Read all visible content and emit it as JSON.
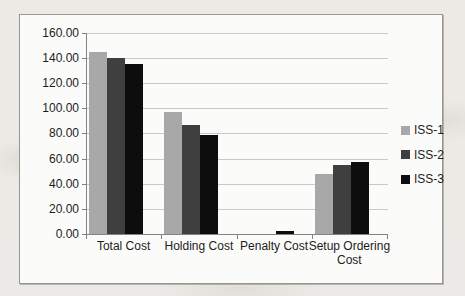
{
  "chart_data": {
    "type": "bar",
    "title": "",
    "xlabel": "",
    "ylabel": "",
    "categories": [
      "Total Cost",
      "Holding Cost",
      "Penalty Cost",
      "Setup Ordering Cost"
    ],
    "series": [
      {
        "name": "ISS-1",
        "color": "#a8a8a8",
        "values": [
          145,
          97,
          0,
          48
        ]
      },
      {
        "name": "ISS-2",
        "color": "#3f3f3f",
        "values": [
          140,
          87,
          0,
          55
        ]
      },
      {
        "name": "ISS-3",
        "color": "#0d0d0d",
        "values": [
          135,
          79,
          2,
          57
        ]
      }
    ],
    "ylim": [
      0,
      160
    ],
    "ytick_step": 20,
    "ytick_labels": [
      "0.00",
      "20.00",
      "40.00",
      "60.00",
      "80.00",
      "100.00",
      "120.00",
      "140.00",
      "160.00"
    ],
    "grid": true,
    "legend_position": "right"
  },
  "frame": {
    "background": "#fbfbfa",
    "border_color": "#98968f",
    "gridline_color": "#c9c9c9",
    "axis_color": "#838383"
  }
}
